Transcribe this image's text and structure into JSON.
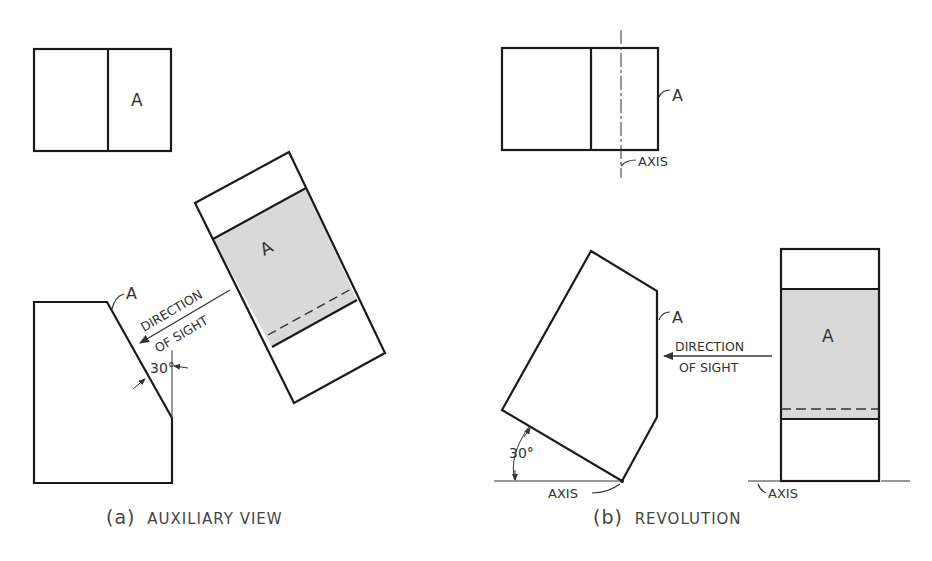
{
  "figure": {
    "panels": [
      {
        "id": "a",
        "caption_prefix": "(a)",
        "caption": "AUXILIARY VIEW",
        "labels": {
          "surface_top": "A",
          "surface_front": "A",
          "surface_aux": "A",
          "direction_line1": "DIRECTION",
          "direction_line2": "OF SIGHT",
          "angle": "30°"
        }
      },
      {
        "id": "b",
        "caption_prefix": "(b)",
        "caption": "REVOLUTION",
        "labels": {
          "surface_top": "A",
          "surface_front": "A",
          "surface_side": "A",
          "axis_top": "AXIS",
          "axis_front": "AXIS",
          "axis_side": "AXIS",
          "direction_line1": "DIRECTION",
          "direction_line2": "OF SIGHT",
          "angle": "30°"
        }
      }
    ],
    "colors": {
      "line": "#1a1a1a",
      "shade": "#d9d9d9",
      "text": "#333333",
      "background": "#ffffff"
    }
  }
}
